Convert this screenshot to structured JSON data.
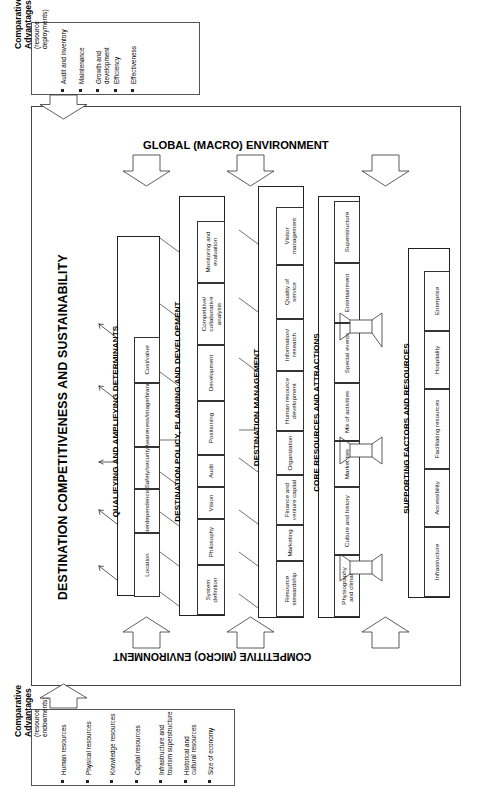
{
  "figure": {
    "headline": "DESTINATION COMPETITIVENESS AND SUSTAINABILITY",
    "macro_env_label": "GLOBAL (MACRO) ENVIRONMENT",
    "micro_env_label": "COMPETITIVE (MICRO) ENVIRONMENT"
  },
  "comparative_top": {
    "title_line1": "Comparative",
    "title_line2": "Advantages",
    "sub_line1": "(resource",
    "sub_line2": "deployments)",
    "items": [
      "Audit and inventory",
      "Maintenance",
      "Growth and|development",
      "Efficiency",
      "Effectiveness"
    ]
  },
  "comparative_bottom": {
    "title_line1": "Comparative",
    "title_line2": "Advantages",
    "sub_line1": "(resource",
    "sub_line2": "endowments)",
    "items": [
      "Human resources",
      "Physical resources",
      "Knowledge resources",
      "Capital resources",
      "Infrastructure and|tourism superstructure",
      "Historical and|cultural resources",
      "Size of economy"
    ]
  },
  "sections": [
    {
      "id": "qualifying",
      "label": "QUALIFYING AND AMPLIFYING DETERMINANTS",
      "cells": [
        "Location",
        "Interdependencies",
        "Safety/security",
        "Awareness/image/brand",
        "Cost/value"
      ]
    },
    {
      "id": "policy",
      "label": "DESTINATION POLICY, PLANNING AND DEVELOPMENT",
      "cells": [
        "System|definition",
        "Philosophy",
        "Vision",
        "Audit",
        "Positioning",
        "Development",
        "Competitive/|collaborative|analysis",
        "Monitoring and|evaluation"
      ]
    },
    {
      "id": "management",
      "label": "DESTINATION MANAGEMENT",
      "cells": [
        "Resource|stewardship",
        "Marketing",
        "Finance and|venture capital",
        "Organization",
        "Human resource|development",
        "Information/|research",
        "Quality of|service",
        "Visitor|management"
      ]
    },
    {
      "id": "core",
      "label": "CORE RESOURCES AND ATTRACTIONS",
      "cells": [
        "Physiography|and climate",
        "Culture and history",
        "Market ties",
        "Mix of activities",
        "Special events",
        "Entertainment",
        "Superstructure"
      ]
    },
    {
      "id": "supporting",
      "label": "SUPPORTING FACTORS AND RESOURCES",
      "cells": [
        "Infrastructure",
        "Accessibility",
        "Facilitating resources",
        "Hospitality",
        "Enterprise"
      ]
    }
  ],
  "icons": {
    "macro_arrow": "down-arrow-icon",
    "micro_arrow": "up-arrow-icon",
    "feed_arrow": "block-arrow-icon",
    "link_arrow": "small-arrow-icon"
  },
  "colors": {
    "background": "#ffffff",
    "stroke": "#333333",
    "text": "#000000"
  }
}
